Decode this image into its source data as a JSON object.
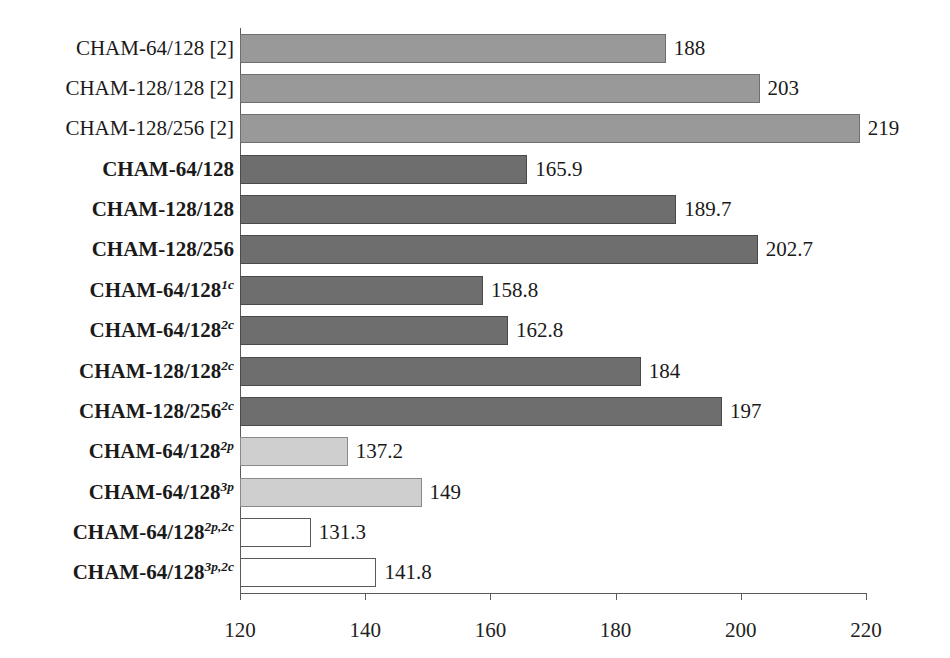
{
  "chart_data": {
    "type": "bar",
    "orientation": "horizontal",
    "title": "",
    "xlabel": "",
    "ylabel": "",
    "xlim": [
      120,
      220
    ],
    "xticks": [
      120,
      140,
      160,
      180,
      200,
      220
    ],
    "xtick_labels": [
      "120",
      "140",
      "160",
      "180",
      "200",
      "220"
    ],
    "grid": false,
    "legend": false,
    "categories": [
      "CHAM-64/128 [2]",
      "CHAM-128/128 [2]",
      "CHAM-128/256 [2]",
      "CHAM-64/128",
      "CHAM-128/128",
      "CHAM-128/256",
      "CHAM-64/128¹ᶜ",
      "CHAM-64/128²ᶜ",
      "CHAM-128/128²ᶜ",
      "CHAM-128/256²ᶜ",
      "CHAM-64/128²ᵖ",
      "CHAM-64/128³ᵖ",
      "CHAM-64/128²ᵖ·²ᶜ",
      "CHAM-64/128³ᵖ·²ᶜ"
    ],
    "values": [
      188,
      203,
      219,
      165.9,
      189.7,
      202.7,
      158.8,
      162.8,
      184,
      197,
      137.2,
      149,
      131.3,
      141.8
    ],
    "value_labels": [
      "188",
      "203",
      "219",
      "165.9",
      "189.7",
      "202.7",
      "158.8",
      "162.8",
      "184",
      "197",
      "137.2",
      "149",
      "131.3",
      "141.8"
    ]
  },
  "bars": [
    {
      "label_base": "CHAM-64/128",
      "label_sup": "",
      "label_suffix": " [2]",
      "bold": false,
      "value": 188,
      "value_label": "188",
      "style": "fill-midgray"
    },
    {
      "label_base": "CHAM-128/128",
      "label_sup": "",
      "label_suffix": " [2]",
      "bold": false,
      "value": 203,
      "value_label": "203",
      "style": "fill-midgray"
    },
    {
      "label_base": "CHAM-128/256",
      "label_sup": "",
      "label_suffix": " [2]",
      "bold": false,
      "value": 219,
      "value_label": "219",
      "style": "fill-midgray"
    },
    {
      "label_base": "CHAM-64/128",
      "label_sup": "",
      "label_suffix": "",
      "bold": true,
      "value": 165.9,
      "value_label": "165.9",
      "style": "fill-darkgray"
    },
    {
      "label_base": "CHAM-128/128",
      "label_sup": "",
      "label_suffix": "",
      "bold": true,
      "value": 189.7,
      "value_label": "189.7",
      "style": "fill-darkgray"
    },
    {
      "label_base": "CHAM-128/256",
      "label_sup": "",
      "label_suffix": "",
      "bold": true,
      "value": 202.7,
      "value_label": "202.7",
      "style": "fill-darkgray"
    },
    {
      "label_base": "CHAM-64/128",
      "label_sup": "1c",
      "label_suffix": "",
      "bold": true,
      "value": 158.8,
      "value_label": "158.8",
      "style": "fill-darkgray"
    },
    {
      "label_base": "CHAM-64/128",
      "label_sup": "2c",
      "label_suffix": "",
      "bold": true,
      "value": 162.8,
      "value_label": "162.8",
      "style": "fill-darkgray"
    },
    {
      "label_base": "CHAM-128/128",
      "label_sup": "2c",
      "label_suffix": "",
      "bold": true,
      "value": 184,
      "value_label": "184",
      "style": "fill-darkgray"
    },
    {
      "label_base": "CHAM-128/256",
      "label_sup": "2c",
      "label_suffix": "",
      "bold": true,
      "value": 197,
      "value_label": "197",
      "style": "fill-darkgray"
    },
    {
      "label_base": "CHAM-64/128",
      "label_sup": "2p",
      "label_suffix": "",
      "bold": true,
      "value": 137.2,
      "value_label": "137.2",
      "style": "fill-lightgray"
    },
    {
      "label_base": "CHAM-64/128",
      "label_sup": "3p",
      "label_suffix": "",
      "bold": true,
      "value": 149,
      "value_label": "149",
      "style": "fill-lightgray"
    },
    {
      "label_base": "CHAM-64/128",
      "label_sup": "2p,2c",
      "label_suffix": "",
      "bold": true,
      "value": 131.3,
      "value_label": "131.3",
      "style": "fill-white"
    },
    {
      "label_base": "CHAM-64/128",
      "label_sup": "3p,2c",
      "label_suffix": "",
      "bold": true,
      "value": 141.8,
      "value_label": "141.8",
      "style": "fill-white"
    }
  ],
  "axis": {
    "ticks": [
      "120",
      "140",
      "160",
      "180",
      "200",
      "220"
    ]
  },
  "colors": {
    "mid_gray": "#999999",
    "dark_gray": "#6e6e6e",
    "light_gray": "#cfcfcf",
    "white": "#ffffff",
    "axis": "#5a5a5a",
    "text": "#1a1a1a"
  }
}
